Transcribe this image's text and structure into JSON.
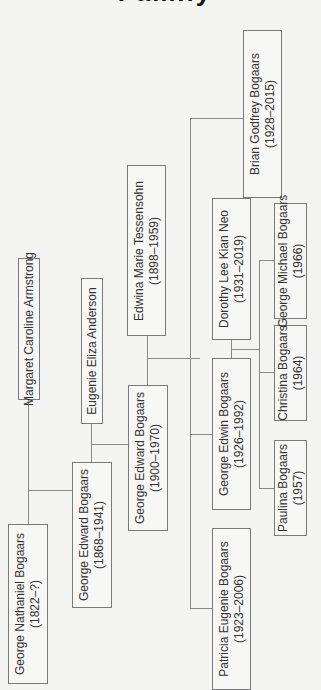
{
  "title": {
    "fragment": "Family Tree"
  },
  "people": [
    {
      "id": "george-nathaniel",
      "name": "George Nathaniel Bogaars",
      "dates": "(1822–?)"
    },
    {
      "id": "margaret-caroline",
      "name": "Margaret Caroline Armstrong",
      "dates": ""
    },
    {
      "id": "george-edward-1868",
      "name": "George Edward Bogaars",
      "dates": "(1868–1941)"
    },
    {
      "id": "eugenie-eliza",
      "name": "Eugenie Eliza Anderson",
      "dates": ""
    },
    {
      "id": "george-edward-1900",
      "name": "George Edward Bogaars",
      "dates": "(1900–1970)"
    },
    {
      "id": "edwina-marie",
      "name": "Edwina Marie Tessensohn",
      "dates": "(1898–1959)"
    },
    {
      "id": "patricia-eugenie",
      "name": "Patricia Eugenie Bogaars",
      "dates": "(1923–2006)"
    },
    {
      "id": "george-edwin",
      "name": "George Edwin Bogaars",
      "dates": "(1926–1992)"
    },
    {
      "id": "dorothy-lee",
      "name": "Dorothy Lee Kian Neo",
      "dates": "(1931–2019)"
    },
    {
      "id": "brian-godfrey",
      "name": "Brian Godfrey Bogaars",
      "dates": "(1928–2015)"
    },
    {
      "id": "paulina",
      "name": "Paulina Bogaars",
      "dates": "(1957)"
    },
    {
      "id": "christina",
      "name": "Christina Bogaars",
      "dates": "(1964)"
    },
    {
      "id": "george-michael",
      "name": "George Michael Bogaars",
      "dates": "(1966)"
    }
  ],
  "colors": {
    "line": "#8a8a8a",
    "border": "#7a7a7a",
    "background": "#f4f4f2",
    "text": "#333333"
  }
}
